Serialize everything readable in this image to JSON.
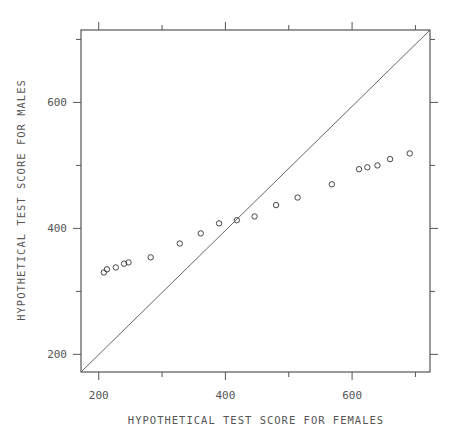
{
  "chart_data": {
    "type": "scatter",
    "title": "",
    "xlabel": "HYPOTHETICAL TEST SCORE FOR FEMALES",
    "ylabel": "HYPOTHETICAL TEST SCORE FOR MALES",
    "xlim": [
      172,
      723
    ],
    "ylim": [
      172,
      715
    ],
    "x_major_ticks": [
      200,
      400,
      600
    ],
    "x_minor_ticks": [
      300,
      500,
      700
    ],
    "y_major_ticks": [
      200,
      400,
      600
    ],
    "y_minor_ticks": [
      300,
      500,
      700
    ],
    "x_tick_labels": [
      "200",
      "400",
      "600"
    ],
    "y_tick_labels": [
      "200",
      "400",
      "600"
    ],
    "grid": false,
    "reference_line": {
      "type": "identity",
      "label": "y = x"
    },
    "marker": "open-circle",
    "series": [
      {
        "name": "scores",
        "points": [
          [
            208,
            330
          ],
          [
            213,
            335
          ],
          [
            227,
            338
          ],
          [
            240,
            344
          ],
          [
            247,
            346
          ],
          [
            282,
            354
          ],
          [
            328,
            376
          ],
          [
            361,
            392
          ],
          [
            390,
            408
          ],
          [
            418,
            413
          ],
          [
            446,
            419
          ],
          [
            480,
            437
          ],
          [
            514,
            449
          ],
          [
            568,
            470
          ],
          [
            611,
            494
          ],
          [
            624,
            497
          ],
          [
            640,
            500
          ],
          [
            660,
            510
          ],
          [
            691,
            519
          ]
        ]
      }
    ]
  }
}
